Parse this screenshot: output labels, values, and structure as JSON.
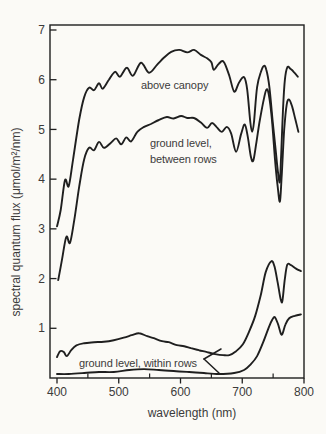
{
  "figure": {
    "background": "#fbfaf6",
    "ink": "#1f1f1f",
    "text_color": "#3b3b3b"
  },
  "chart_data": {
    "type": "line",
    "title": "",
    "xlabel": "wavelength (nm)",
    "ylabel": "spectral quantum flux (μmol/m²/nm)",
    "xlim": [
      400,
      800
    ],
    "ylim": [
      0,
      7
    ],
    "grid": false,
    "frame": true,
    "x_major_ticks": [
      400,
      500,
      600,
      700,
      800
    ],
    "x_minor_ticks": [
      450,
      550,
      650,
      750
    ],
    "y_ticks": [
      1,
      2,
      3,
      4,
      5,
      6,
      7
    ],
    "curve_labels": {
      "above_canopy": "above canopy",
      "between_rows_line1": "ground level,",
      "between_rows_line2": "between rows",
      "within_rows": "ground level, within rows"
    },
    "pointer": {
      "description": "angle bracket linking the within-rows label to its two curves",
      "vertex_px": [
        204,
        359
      ],
      "arms_px": [
        [
          221,
          349
        ],
        [
          219,
          373
        ]
      ]
    },
    "series": [
      {
        "name": "above canopy",
        "points": [
          [
            400,
            3.05
          ],
          [
            406,
            3.38
          ],
          [
            413,
            3.98
          ],
          [
            419,
            3.86
          ],
          [
            426,
            4.4
          ],
          [
            436,
            5.2
          ],
          [
            444,
            5.65
          ],
          [
            452,
            5.84
          ],
          [
            460,
            5.79
          ],
          [
            468,
            5.93
          ],
          [
            474,
            5.82
          ],
          [
            484,
            6.0
          ],
          [
            494,
            6.16
          ],
          [
            502,
            6.06
          ],
          [
            513,
            6.24
          ],
          [
            523,
            6.08
          ],
          [
            536,
            6.34
          ],
          [
            549,
            6.14
          ],
          [
            562,
            6.3
          ],
          [
            573,
            6.44
          ],
          [
            585,
            6.56
          ],
          [
            598,
            6.6
          ],
          [
            611,
            6.55
          ],
          [
            622,
            6.6
          ],
          [
            633,
            6.5
          ],
          [
            643,
            6.43
          ],
          [
            650,
            6.35
          ],
          [
            654,
            6.2
          ],
          [
            662,
            6.32
          ],
          [
            670,
            6.36
          ],
          [
            679,
            6.08
          ],
          [
            687,
            5.76
          ],
          [
            695,
            5.95
          ],
          [
            703,
            6.05
          ],
          [
            708,
            5.8
          ],
          [
            713,
            5.15
          ],
          [
            716,
            4.95
          ],
          [
            719,
            5.15
          ],
          [
            724,
            5.85
          ],
          [
            730,
            6.15
          ],
          [
            735,
            6.28
          ],
          [
            739,
            6.2
          ],
          [
            744,
            5.85
          ],
          [
            749,
            5.2
          ],
          [
            754,
            4.6
          ],
          [
            758,
            4.12
          ],
          [
            761,
            3.95
          ],
          [
            763,
            4.5
          ],
          [
            766,
            5.4
          ],
          [
            769,
            6.0
          ],
          [
            773,
            6.25
          ],
          [
            778,
            6.22
          ],
          [
            784,
            6.15
          ],
          [
            790,
            6.06
          ]
        ]
      },
      {
        "name": "ground level, between rows",
        "points": [
          [
            402,
            1.97
          ],
          [
            408,
            2.37
          ],
          [
            415,
            2.84
          ],
          [
            421,
            2.72
          ],
          [
            428,
            3.18
          ],
          [
            436,
            3.85
          ],
          [
            444,
            4.4
          ],
          [
            452,
            4.63
          ],
          [
            460,
            4.58
          ],
          [
            468,
            4.75
          ],
          [
            476,
            4.63
          ],
          [
            487,
            4.73
          ],
          [
            496,
            4.82
          ],
          [
            504,
            4.7
          ],
          [
            512,
            4.84
          ],
          [
            520,
            4.76
          ],
          [
            530,
            4.95
          ],
          [
            541,
            5.05
          ],
          [
            552,
            5.11
          ],
          [
            565,
            5.19
          ],
          [
            578,
            5.25
          ],
          [
            589,
            5.22
          ],
          [
            601,
            5.27
          ],
          [
            611,
            5.23
          ],
          [
            622,
            5.23
          ],
          [
            633,
            5.14
          ],
          [
            643,
            5.03
          ],
          [
            651,
            5.13
          ],
          [
            659,
            5.04
          ],
          [
            667,
            4.95
          ],
          [
            675,
            5.05
          ],
          [
            682,
            4.92
          ],
          [
            690,
            4.55
          ],
          [
            698,
            4.9
          ],
          [
            704,
            5.1
          ],
          [
            709,
            4.85
          ],
          [
            714,
            4.45
          ],
          [
            718,
            4.38
          ],
          [
            723,
            4.75
          ],
          [
            728,
            5.15
          ],
          [
            734,
            5.55
          ],
          [
            739,
            5.8
          ],
          [
            743,
            5.7
          ],
          [
            748,
            5.2
          ],
          [
            753,
            4.4
          ],
          [
            757,
            3.9
          ],
          [
            761,
            3.55
          ],
          [
            764,
            4.1
          ],
          [
            768,
            5.0
          ],
          [
            772,
            5.5
          ],
          [
            776,
            5.6
          ],
          [
            781,
            5.45
          ],
          [
            786,
            5.2
          ],
          [
            791,
            4.95
          ]
        ]
      },
      {
        "name": "ground level, within rows (upper curve)",
        "points": [
          [
            400,
            0.42
          ],
          [
            405,
            0.54
          ],
          [
            411,
            0.52
          ],
          [
            416,
            0.44
          ],
          [
            423,
            0.56
          ],
          [
            432,
            0.66
          ],
          [
            444,
            0.7
          ],
          [
            460,
            0.72
          ],
          [
            476,
            0.73
          ],
          [
            492,
            0.76
          ],
          [
            508,
            0.81
          ],
          [
            521,
            0.86
          ],
          [
            533,
            0.9
          ],
          [
            546,
            0.84
          ],
          [
            557,
            0.8
          ],
          [
            570,
            0.74
          ],
          [
            581,
            0.72
          ],
          [
            594,
            0.66
          ],
          [
            606,
            0.64
          ],
          [
            617,
            0.6
          ],
          [
            630,
            0.56
          ],
          [
            643,
            0.52
          ],
          [
            656,
            0.48
          ],
          [
            669,
            0.46
          ],
          [
            679,
            0.46
          ],
          [
            690,
            0.54
          ],
          [
            701,
            0.68
          ],
          [
            711,
            0.93
          ],
          [
            721,
            1.25
          ],
          [
            730,
            1.67
          ],
          [
            738,
            2.13
          ],
          [
            747,
            2.35
          ],
          [
            752,
            2.25
          ],
          [
            757,
            1.95
          ],
          [
            762,
            1.6
          ],
          [
            765,
            1.55
          ],
          [
            769,
            2.0
          ],
          [
            773,
            2.28
          ],
          [
            779,
            2.27
          ],
          [
            787,
            2.2
          ],
          [
            795,
            2.15
          ]
        ]
      },
      {
        "name": "ground level, within rows (lower curve)",
        "points": [
          [
            400,
            0.08
          ],
          [
            419,
            0.08
          ],
          [
            444,
            0.1
          ],
          [
            468,
            0.12
          ],
          [
            492,
            0.12
          ],
          [
            517,
            0.16
          ],
          [
            541,
            0.18
          ],
          [
            565,
            0.16
          ],
          [
            589,
            0.14
          ],
          [
            614,
            0.12
          ],
          [
            638,
            0.1
          ],
          [
            662,
            0.08
          ],
          [
            687,
            0.1
          ],
          [
            703,
            0.16
          ],
          [
            714,
            0.28
          ],
          [
            724,
            0.44
          ],
          [
            734,
            0.72
          ],
          [
            743,
            1.02
          ],
          [
            749,
            1.18
          ],
          [
            753,
            1.22
          ],
          [
            758,
            1.08
          ],
          [
            763,
            0.88
          ],
          [
            766,
            0.92
          ],
          [
            770,
            1.08
          ],
          [
            776,
            1.2
          ],
          [
            785,
            1.25
          ],
          [
            795,
            1.28
          ]
        ]
      }
    ]
  }
}
